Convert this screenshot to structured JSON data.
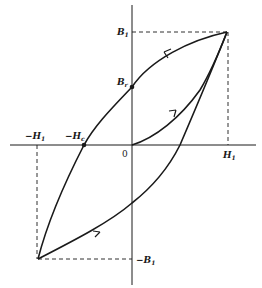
{
  "diagram": {
    "type": "hysteresis-loop",
    "colors": {
      "stroke": "#1a1a1a",
      "background": "#ffffff"
    },
    "labels": {
      "b1_top": {
        "main": "B",
        "sub": "1"
      },
      "br": {
        "main": "B",
        "sub": "r"
      },
      "neg_h1": {
        "main": "−H",
        "sub": "1"
      },
      "neg_hc": {
        "main": "−H",
        "sub": "c"
      },
      "origin": "0",
      "h1": {
        "main": "H",
        "sub": "1"
      },
      "neg_b1": {
        "main": "−B",
        "sub": "1"
      }
    },
    "points": {
      "origin": [
        132,
        145
      ],
      "tip_positive": [
        227,
        32
      ],
      "tip_negative": [
        38,
        259
      ],
      "remanence": [
        132,
        87
      ],
      "coercivity": [
        84,
        145
      ]
    }
  }
}
